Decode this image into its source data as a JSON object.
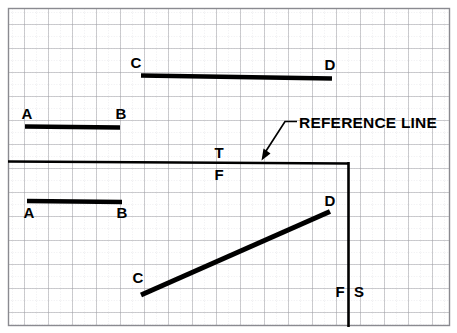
{
  "figure": {
    "background_color": "#ffffff",
    "ink_color": "#000000",
    "grid": {
      "major_color": "#9a9a9e",
      "minor_color": "#c9c9cf",
      "major_spacing": 24,
      "minor_spacing": 12,
      "border_color": "#8a8a90"
    }
  },
  "labels": {
    "reference_line": "REFERENCE LINE",
    "top_view_c": "C",
    "top_view_d": "D",
    "front_view_upper_a": "A",
    "front_view_upper_b": "B",
    "plane_top": "T",
    "plane_front": "F",
    "front_view_lower_a": "A",
    "front_view_lower_b": "B",
    "side_view_c": "C",
    "side_view_d": "D",
    "plane_front_bottom": "F",
    "plane_side": "S"
  },
  "geometry": {
    "top_line_cd": {
      "x1": 141,
      "y1": 75,
      "x2": 332,
      "y2": 78
    },
    "upper_line_ab": {
      "x1": 25,
      "y1": 126,
      "x2": 120,
      "y2": 127
    },
    "reference_line_horizontal": {
      "x1": 8,
      "y1": 161,
      "x2": 348,
      "y2": 163
    },
    "reference_line_vertical": {
      "x1": 348,
      "y1": 163,
      "x2": 348,
      "y2": 327
    },
    "lower_line_ab": {
      "x1": 27,
      "y1": 201,
      "x2": 122,
      "y2": 202
    },
    "diagonal_line_cd": {
      "x1": 141,
      "y1": 295,
      "x2": 330,
      "y2": 212
    },
    "leader_horizontal": {
      "x1": 285,
      "y1": 122,
      "x2": 297,
      "y2": 122
    },
    "leader_diagonal": {
      "x1": 285,
      "y1": 122,
      "x2": 263,
      "y2": 158
    }
  }
}
